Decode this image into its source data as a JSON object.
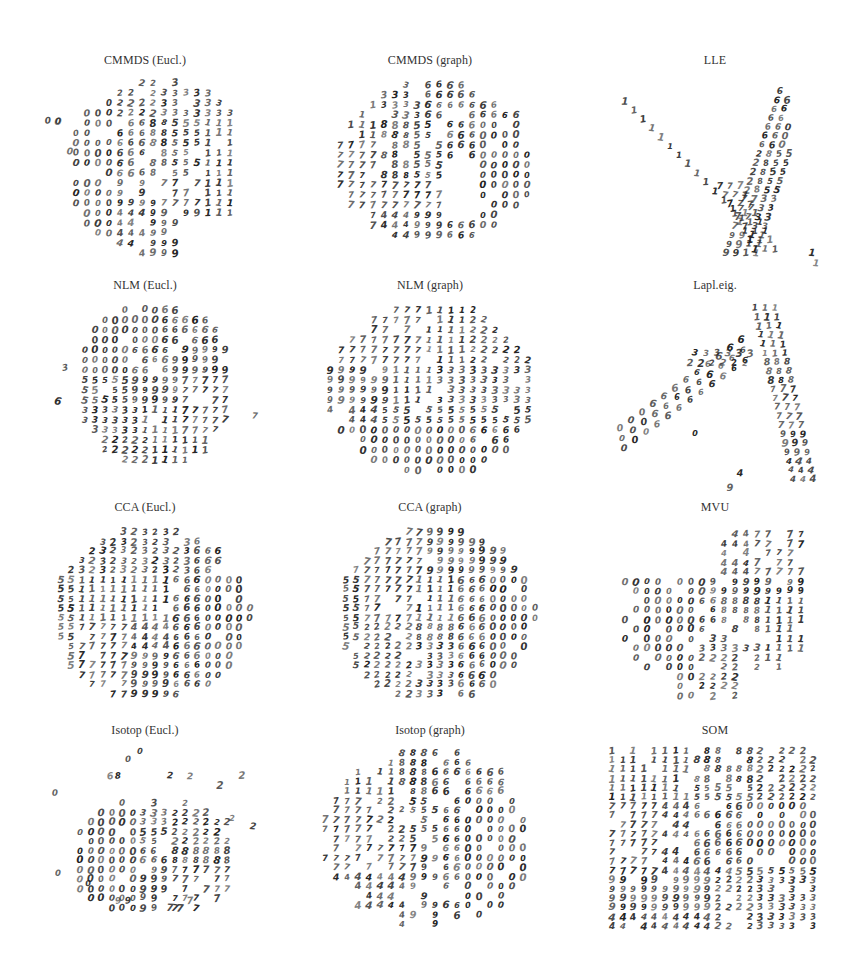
{
  "figure": {
    "layout": {
      "rows": 4,
      "cols": 3
    }
  },
  "chart_data": [
    {
      "type": "scatter",
      "title": "CMMDS (Eucl.)",
      "marker": "digit-glyph",
      "xlabel": "",
      "ylabel": "",
      "grid": false,
      "axes": false,
      "clusters": [
        {
          "label": "0",
          "region": "left"
        },
        {
          "label": "2",
          "region": "top"
        },
        {
          "label": "3",
          "region": "top-center"
        },
        {
          "label": "1",
          "region": "right"
        },
        {
          "label": "6",
          "region": "center-left"
        },
        {
          "label": "5",
          "region": "center"
        },
        {
          "label": "8",
          "region": "center"
        },
        {
          "label": "4",
          "region": "bottom-left"
        },
        {
          "label": "9",
          "region": "bottom"
        },
        {
          "label": "7",
          "region": "bottom-right"
        }
      ],
      "shape": "roughly circular with cluster of 0s jutting left"
    },
    {
      "type": "scatter",
      "title": "CMMDS (graph)",
      "marker": "digit-glyph",
      "xlabel": "",
      "ylabel": "",
      "grid": false,
      "axes": false,
      "clusters": [
        {
          "label": "1",
          "region": "top-left"
        },
        {
          "label": "2",
          "region": "top"
        },
        {
          "label": "3",
          "region": "top-center"
        },
        {
          "label": "5",
          "region": "top-center"
        },
        {
          "label": "6",
          "region": "top-right"
        },
        {
          "label": "8",
          "region": "center"
        },
        {
          "label": "0",
          "region": "right"
        },
        {
          "label": "7",
          "region": "left"
        },
        {
          "label": "4",
          "region": "bottom-left"
        },
        {
          "label": "9",
          "region": "bottom"
        }
      ],
      "shape": "oval with a hollow center-right"
    },
    {
      "type": "scatter",
      "title": "LLE",
      "marker": "digit-glyph",
      "xlabel": "",
      "ylabel": "",
      "grid": false,
      "axes": false,
      "clusters": [
        {
          "label": "1",
          "region": "diagonal arm from top-left"
        },
        {
          "label": "0",
          "region": "top-right column"
        },
        {
          "label": "6",
          "region": "right column"
        },
        {
          "label": "2",
          "region": "center-right"
        },
        {
          "label": "8",
          "region": "center-right"
        },
        {
          "label": "3",
          "region": "center-right"
        },
        {
          "label": "5",
          "region": "center-right"
        },
        {
          "label": "7",
          "region": "lower center"
        },
        {
          "label": "9",
          "region": "bottom"
        },
        {
          "label": "1",
          "region": "bottom-right tail"
        }
      ],
      "shape": "V / checkmark shape"
    },
    {
      "type": "scatter",
      "title": "NLM (Eucl.)",
      "marker": "digit-glyph",
      "xlabel": "",
      "ylabel": "",
      "grid": false,
      "axes": false,
      "clusters": [
        {
          "label": "0",
          "region": "top-left"
        },
        {
          "label": "6",
          "region": "top-center"
        },
        {
          "label": "4",
          "region": "top-right"
        },
        {
          "label": "9",
          "region": "right"
        },
        {
          "label": "7",
          "region": "right"
        },
        {
          "label": "5",
          "region": "center-left"
        },
        {
          "label": "8",
          "region": "center"
        },
        {
          "label": "3",
          "region": "left"
        },
        {
          "label": "2",
          "region": "bottom-left"
        },
        {
          "label": "1",
          "region": "bottom-center"
        }
      ],
      "shape": "compact disc with outliers left and right"
    },
    {
      "type": "scatter",
      "title": "NLM (graph)",
      "marker": "digit-glyph",
      "xlabel": "",
      "ylabel": "",
      "grid": false,
      "axes": false,
      "clusters": [
        {
          "label": "7",
          "region": "top-left"
        },
        {
          "label": "1",
          "region": "top-center"
        },
        {
          "label": "2",
          "region": "top-right"
        },
        {
          "label": "9",
          "region": "left"
        },
        {
          "label": "4",
          "region": "left"
        },
        {
          "label": "3",
          "region": "right"
        },
        {
          "label": "5",
          "region": "center"
        },
        {
          "label": "8",
          "region": "center-right"
        },
        {
          "label": "6",
          "region": "bottom-right"
        },
        {
          "label": "0",
          "region": "bottom"
        }
      ],
      "shape": "large disc"
    },
    {
      "type": "scatter",
      "title": "Lapl.eig.",
      "marker": "digit-glyph",
      "xlabel": "",
      "ylabel": "",
      "grid": false,
      "axes": false,
      "clusters": [
        {
          "label": "0",
          "region": "bottom-left"
        },
        {
          "label": "6",
          "region": "left diagonal arm"
        },
        {
          "label": "2",
          "region": "center"
        },
        {
          "label": "3",
          "region": "center"
        },
        {
          "label": "8",
          "region": "center-right"
        },
        {
          "label": "1",
          "region": "top-right"
        },
        {
          "label": "5",
          "region": "right"
        },
        {
          "label": "7",
          "region": "right column"
        },
        {
          "label": "9",
          "region": "bottom-right"
        },
        {
          "label": "4",
          "region": "bottom-right"
        }
      ],
      "shape": "inverted V / A shape"
    },
    {
      "type": "scatter",
      "title": "CCA (Eucl.)",
      "marker": "digit-glyph",
      "xlabel": "",
      "ylabel": "",
      "grid": false,
      "axes": false,
      "clusters": [
        {
          "label": "2",
          "region": "top"
        },
        {
          "label": "3",
          "region": "top-center"
        },
        {
          "label": "8",
          "region": "top-center"
        },
        {
          "label": "6",
          "region": "top-right"
        },
        {
          "label": "1",
          "region": "left-center"
        },
        {
          "label": "5",
          "region": "left edge"
        },
        {
          "label": "0",
          "region": "right"
        },
        {
          "label": "7",
          "region": "bottom-left"
        },
        {
          "label": "9",
          "region": "bottom"
        },
        {
          "label": "4",
          "region": "bottom-center"
        }
      ],
      "shape": "filled circle"
    },
    {
      "type": "scatter",
      "title": "CCA (graph)",
      "marker": "digit-glyph",
      "xlabel": "",
      "ylabel": "",
      "grid": false,
      "axes": false,
      "clusters": [
        {
          "label": "4",
          "region": "top"
        },
        {
          "label": "9",
          "region": "top-center"
        },
        {
          "label": "7",
          "region": "top-left"
        },
        {
          "label": "1",
          "region": "center-left"
        },
        {
          "label": "5",
          "region": "left edge"
        },
        {
          "label": "6",
          "region": "center-right"
        },
        {
          "label": "0",
          "region": "right"
        },
        {
          "label": "2",
          "region": "bottom-left"
        },
        {
          "label": "8",
          "region": "bottom"
        },
        {
          "label": "3",
          "region": "bottom-center"
        }
      ],
      "shape": "filled circle"
    },
    {
      "type": "scatter",
      "title": "MVU",
      "marker": "digit-glyph",
      "xlabel": "",
      "ylabel": "",
      "grid": false,
      "axes": false,
      "clusters": [
        {
          "label": "7",
          "region": "top-right"
        },
        {
          "label": "9",
          "region": "top-center"
        },
        {
          "label": "4",
          "region": "top-center"
        },
        {
          "label": "0",
          "region": "left"
        },
        {
          "label": "6",
          "region": "center"
        },
        {
          "label": "8",
          "region": "center"
        },
        {
          "label": "5",
          "region": "center"
        },
        {
          "label": "3",
          "region": "lower center"
        },
        {
          "label": "2",
          "region": "bottom"
        },
        {
          "label": "1",
          "region": "right"
        }
      ],
      "shape": "irregular blob with 7s protruding up"
    },
    {
      "type": "scatter",
      "title": "Isotop (Eucl.)",
      "marker": "digit-glyph",
      "xlabel": "",
      "ylabel": "",
      "grid": false,
      "axes": false,
      "clusters": [
        {
          "label": "0",
          "region": "left"
        },
        {
          "label": "2",
          "region": "top-right"
        },
        {
          "label": "1",
          "region": "top-center"
        },
        {
          "label": "3",
          "region": "top-center"
        },
        {
          "label": "5",
          "region": "center-left"
        },
        {
          "label": "6",
          "region": "center"
        },
        {
          "label": "8",
          "region": "center"
        },
        {
          "label": "9",
          "region": "center-bottom"
        },
        {
          "label": "7",
          "region": "bottom-right"
        },
        {
          "label": "4",
          "region": "sparse"
        }
      ],
      "shape": "sparse ellipse with scattered outliers"
    },
    {
      "type": "scatter",
      "title": "Isotop (graph)",
      "marker": "digit-glyph",
      "xlabel": "",
      "ylabel": "",
      "grid": false,
      "axes": false,
      "clusters": [
        {
          "label": "1",
          "region": "top-left"
        },
        {
          "label": "8",
          "region": "top-center"
        },
        {
          "label": "5",
          "region": "center"
        },
        {
          "label": "6",
          "region": "top-right"
        },
        {
          "label": "0",
          "region": "right"
        },
        {
          "label": "3",
          "region": "center"
        },
        {
          "label": "2",
          "region": "center-left"
        },
        {
          "label": "7",
          "region": "left"
        },
        {
          "label": "9",
          "region": "bottom-center"
        },
        {
          "label": "4",
          "region": "bottom-left"
        }
      ],
      "shape": "oval"
    },
    {
      "type": "scatter",
      "title": "SOM",
      "marker": "digit-glyph",
      "xlabel": "",
      "ylabel": "",
      "grid": false,
      "axes": false,
      "clusters": [
        {
          "label": "1",
          "region": "top-left"
        },
        {
          "label": "8",
          "region": "top-center"
        },
        {
          "label": "2",
          "region": "top-right"
        },
        {
          "label": "5",
          "region": "upper-center"
        },
        {
          "label": "6",
          "region": "center"
        },
        {
          "label": "0",
          "region": "right"
        },
        {
          "label": "7",
          "region": "left"
        },
        {
          "label": "4",
          "region": "center-left"
        },
        {
          "label": "9",
          "region": "bottom-left"
        },
        {
          "label": "3",
          "region": "bottom-right"
        }
      ],
      "shape": "regular rectangular grid 20x20"
    }
  ],
  "panels": [
    {
      "title": "CMMDS (Eucl.)"
    },
    {
      "title": "CMMDS (graph)"
    },
    {
      "title": "LLE"
    },
    {
      "title": "NLM (Eucl.)"
    },
    {
      "title": "NLM (graph)"
    },
    {
      "title": "Lapl.eig."
    },
    {
      "title": "CCA (Eucl.)"
    },
    {
      "title": "CCA (graph)"
    },
    {
      "title": "MVU"
    },
    {
      "title": "Isotop (Eucl.)"
    },
    {
      "title": "Isotop (graph)"
    },
    {
      "title": "SOM"
    }
  ]
}
